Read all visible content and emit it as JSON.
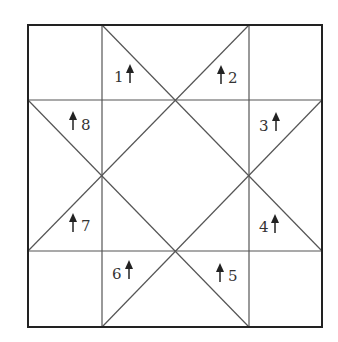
{
  "diagram": {
    "type": "quilt-block-piecing-diagram",
    "colors": {
      "outer_border": "#222222",
      "inner_lines": "#555555",
      "labels": "#333333",
      "background": "#ffffff"
    },
    "grid": {
      "columns": 3,
      "rows": 3
    },
    "pieces": [
      {
        "id": "1",
        "label": "1",
        "arrow": "up"
      },
      {
        "id": "2",
        "label": "2",
        "arrow": "up"
      },
      {
        "id": "3",
        "label": "3",
        "arrow": "up"
      },
      {
        "id": "4",
        "label": "4",
        "arrow": "up"
      },
      {
        "id": "5",
        "label": "5",
        "arrow": "up"
      },
      {
        "id": "6",
        "label": "6",
        "arrow": "up"
      },
      {
        "id": "7",
        "label": "7",
        "arrow": "up"
      },
      {
        "id": "8",
        "label": "8",
        "arrow": "up"
      }
    ]
  }
}
